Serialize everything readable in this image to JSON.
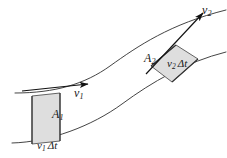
{
  "figure": {
    "domain": "diagram",
    "background_color": "#ffffff",
    "stroke_color": "#3a3a3a",
    "arrow_color": "#111111",
    "slab_fill_color": "#dedede",
    "slab_stroke_color": "#4a4a4a",
    "width": 227,
    "height": 158
  },
  "labels": {
    "velocity_1": {
      "symbol": "v",
      "subscript": "1",
      "text": "v1"
    },
    "velocity_2": {
      "symbol": "v",
      "subscript": "2",
      "text": "v2"
    },
    "area_1": {
      "symbol": "A",
      "subscript": "1",
      "text": "A1"
    },
    "area_2": {
      "symbol": "A",
      "subscript": "2",
      "text": "A2"
    },
    "displacement_1": {
      "symbol": "v",
      "subscript": "1",
      "delta": "Δt",
      "text": "v1 Δt"
    },
    "displacement_2": {
      "symbol": "v",
      "subscript": "2",
      "delta": "Δt",
      "text": "v2 Δt"
    }
  },
  "geometry": {
    "upper_wall": "M 15,93 C 55,93 85,84 110,66 C 138,46 170,24 226,10",
    "lower_wall": "M 12,143 C 50,142 92,126 122,104 C 152,82 186,62 226,52",
    "slab_1": {
      "points": "32,96 32,144 60,141 60,93",
      "area_label": "A1"
    },
    "slab_2": {
      "points": "151,66 176,45 198,59 172,82",
      "area_label": "A2"
    },
    "arrow_1": {
      "from": [
        38,
        91
      ],
      "to": [
        92,
        85
      ],
      "label": "v1"
    },
    "arrow_2": {
      "from": [
        148,
        72
      ],
      "to": [
        205,
        14
      ],
      "label": "v2"
    }
  }
}
